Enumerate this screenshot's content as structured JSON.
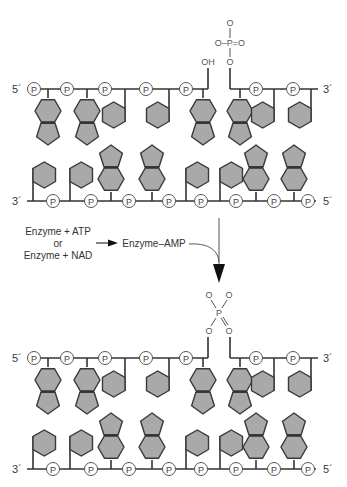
{
  "diagram": {
    "colors": {
      "base_fill": "#a9a9a9",
      "line": "#333333",
      "background": "#ffffff"
    },
    "phosphate_label": "P",
    "panels": [
      {
        "name": "before",
        "top_strand": {
          "left_end": "5´",
          "right_end": "3´",
          "phosphates_x": [
            34,
            67,
            105,
            146,
            186,
            256,
            293
          ],
          "stems_x": [
            48,
            87,
            125,
            169,
            203,
            240,
            274,
            311
          ],
          "bases": [
            "purine",
            "purine",
            "pyrimidine",
            "pyrimidine",
            "purine",
            "purine",
            "pyrimidine",
            "pyrimidine"
          ]
        },
        "bottom_strand": {
          "left_end": "3´",
          "right_end": "5´",
          "phosphates_x": [
            53,
            91,
            129,
            169,
            201,
            236,
            274,
            308
          ],
          "stems_x": [
            33,
            70,
            111,
            152,
            186,
            220,
            256,
            294
          ],
          "bases": [
            "pyrimidine",
            "pyrimidine",
            "purine",
            "purine",
            "pyrimidine",
            "pyrimidine",
            "purine",
            "purine"
          ]
        },
        "nick": {
          "hydroxyl_label": "OH",
          "phosphate_group": {
            "top": "O",
            "middle": "O–P=O",
            "bottom": "O"
          }
        }
      },
      {
        "name": "after",
        "top_strand": {
          "left_end": "5´",
          "right_end": "3´",
          "bases": [
            "purine",
            "purine",
            "pyrimidine",
            "pyrimidine",
            "purine",
            "purine",
            "pyrimidine",
            "pyrimidine"
          ]
        },
        "bottom_strand": {
          "left_end": "3´",
          "right_end": "5´",
          "bases": [
            "pyrimidine",
            "pyrimidine",
            "purine",
            "purine",
            "pyrimidine",
            "pyrimidine",
            "purine",
            "purine"
          ]
        },
        "sealed_phosphate": {
          "top_left": "O",
          "top_right": "O",
          "center": "P",
          "bottom_left": "O",
          "bottom_right": "O"
        }
      }
    ],
    "reaction": {
      "line1": "Enzyme + ATP",
      "line2": "or",
      "line3": "Enzyme + NAD",
      "product": "Enzyme–AMP"
    }
  }
}
